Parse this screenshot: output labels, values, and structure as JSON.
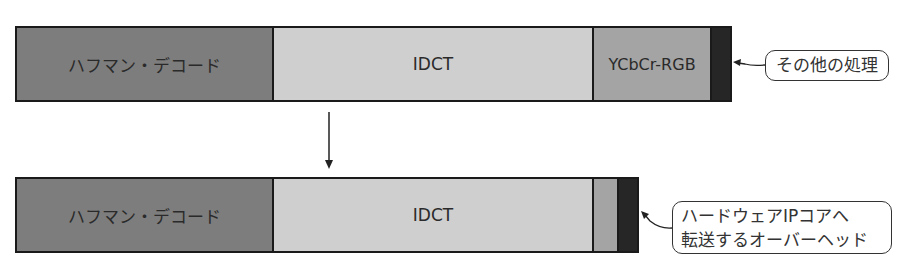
{
  "before": {
    "segments": [
      {
        "label": "ハフマン・デコード",
        "width": 255
      },
      {
        "label": "IDCT",
        "width": 320
      },
      {
        "label": "YCbCr-RGB",
        "width": 118
      },
      {
        "label": "",
        "width": 22
      }
    ],
    "callout": "その他の処理"
  },
  "after": {
    "segments": [
      {
        "label": "ハフマン・デコード",
        "width": 255
      },
      {
        "label": "IDCT",
        "width": 320
      },
      {
        "label": "",
        "width": 25
      },
      {
        "label": "",
        "width": 23
      }
    ],
    "callout_line1": "ハードウェアIPコアへ",
    "callout_line2": "転送するオーバーヘッド"
  },
  "colors": {
    "huffman": "#7d7d7d",
    "idct": "#cfcfcf",
    "ycbcr": "#a4a4a4",
    "other": "#262626"
  }
}
